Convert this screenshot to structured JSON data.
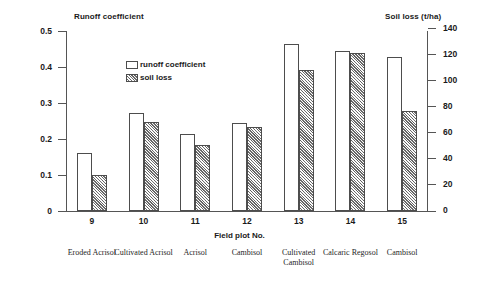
{
  "chart_data": {
    "type": "bar",
    "title": "",
    "categories": [
      "9",
      "10",
      "11",
      "12",
      "13",
      "14",
      "15"
    ],
    "x": [
      9,
      10,
      11,
      12,
      13,
      14,
      15
    ],
    "xlabel": "Field plot No.",
    "grid": false,
    "legend_position": "inside-top-center",
    "series": [
      {
        "name": "runoff coefficient",
        "axis": "left",
        "values": [
          0.16,
          0.272,
          0.214,
          0.245,
          0.465,
          0.445,
          0.428
        ]
      },
      {
        "name": "soil loss",
        "axis": "right",
        "values": [
          28,
          69,
          51,
          65,
          110,
          123,
          78
        ]
      }
    ],
    "left_axis": {
      "label": "Runoff coefficient",
      "ylim": [
        0,
        0.5
      ],
      "ticks": [
        0.5,
        0.4,
        0.3,
        0.2,
        0.1,
        0
      ],
      "tick_labels": [
        "0.5",
        "0.4",
        "0.3",
        "0.2",
        "0.1",
        "0"
      ]
    },
    "right_axis": {
      "label": "Soil loss (t/ha)",
      "ylim": [
        0,
        140
      ],
      "ticks": [
        140,
        120,
        100,
        80,
        60,
        40,
        20,
        0
      ],
      "tick_labels": [
        "140",
        "120",
        "100",
        "80",
        "60",
        "40",
        "20",
        "0"
      ]
    },
    "soil_types": [
      "Eroded Acrisol",
      "Cultivated Acrisol",
      "Acrisol",
      "Cambisol",
      "Cultivated Cambisol",
      "Calcaric Regosol",
      "Cambisol"
    ],
    "colors": {
      "runoff_fill": "#ffffff",
      "soil_fill": "#b4b4b4",
      "outline": "#4d4d4d",
      "axis": "#555555",
      "text": "#1a1a1a"
    }
  },
  "legend": {
    "items": [
      {
        "label": "runoff coefficient",
        "swatch": "runoff"
      },
      {
        "label": "soil loss",
        "swatch": "soil"
      }
    ]
  }
}
